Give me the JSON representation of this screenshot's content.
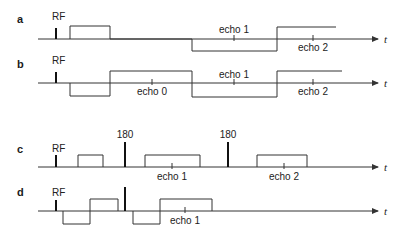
{
  "figure": {
    "width": 400,
    "height": 235,
    "colors": {
      "line": "#333333",
      "spike": "#111111",
      "text": "#222222",
      "background": "#ffffff"
    },
    "axis_end_x": 378,
    "axis_start_x": 38,
    "axis_label": "t",
    "panels": [
      {
        "id": "a",
        "label": "a",
        "baseline_y": 39,
        "label_y": 23,
        "spikes": [
          {
            "x": 56,
            "top": 28,
            "label": "RF",
            "label_y": 20
          }
        ],
        "waveform_points": [
          [
            70,
            39
          ],
          [
            70,
            26
          ],
          [
            110,
            26
          ],
          [
            110,
            39
          ],
          [
            192,
            39
          ],
          [
            192,
            51
          ],
          [
            277,
            51
          ],
          [
            277,
            27
          ],
          [
            336,
            27
          ]
        ],
        "echoes": [
          {
            "label": "echo 1",
            "x": 234,
            "position": "above",
            "label_y": 33
          },
          {
            "label": "echo 2",
            "x": 313,
            "position": "below",
            "label_y": 51
          }
        ]
      },
      {
        "id": "b",
        "label": "b",
        "baseline_y": 83,
        "label_y": 68,
        "spikes": [
          {
            "x": 56,
            "top": 72,
            "label": "RF",
            "label_y": 64
          }
        ],
        "waveform_points": [
          [
            70,
            83
          ],
          [
            70,
            96
          ],
          [
            110,
            96
          ],
          [
            110,
            71
          ],
          [
            192,
            71
          ],
          [
            192,
            97
          ],
          [
            277,
            97
          ],
          [
            277,
            71
          ],
          [
            342,
            71
          ]
        ],
        "echoes": [
          {
            "label": "echo 0",
            "x": 152,
            "position": "below",
            "label_y": 95
          },
          {
            "label": "echo 1",
            "x": 234,
            "position": "above",
            "label_y": 78
          },
          {
            "label": "echo 2",
            "x": 313,
            "position": "below",
            "label_y": 95
          }
        ]
      },
      {
        "id": "c",
        "label": "c",
        "baseline_y": 167,
        "label_y": 153,
        "spikes": [
          {
            "x": 56,
            "top": 155,
            "label": "RF",
            "label_y": 152
          },
          {
            "x": 125,
            "top": 142,
            "label": "180",
            "label_y": 138
          },
          {
            "x": 228,
            "top": 142,
            "label": "180",
            "label_y": 138
          }
        ],
        "waveform_points_list": [
          [
            [
              78,
              167
            ],
            [
              78,
              155
            ],
            [
              103,
              155
            ],
            [
              103,
              167
            ]
          ],
          [
            [
              145,
              167
            ],
            [
              145,
              155
            ],
            [
              200,
              155
            ],
            [
              200,
              167
            ]
          ],
          [
            [
              257,
              167
            ],
            [
              257,
              155
            ],
            [
              307,
              155
            ],
            [
              307,
              167
            ]
          ]
        ],
        "echoes": [
          {
            "label": "echo 1",
            "x": 172,
            "position": "below",
            "label_y": 180
          },
          {
            "label": "echo 2",
            "x": 284,
            "position": "below",
            "label_y": 180
          }
        ]
      },
      {
        "id": "d",
        "label": "d",
        "baseline_y": 211,
        "label_y": 196,
        "spikes": [
          {
            "x": 56,
            "top": 200,
            "label": "RF",
            "label_y": 196
          },
          {
            "x": 125,
            "top": 187,
            "label": ""
          }
        ],
        "waveform_points_list": [
          [
            [
              63,
              211
            ],
            [
              63,
              224
            ],
            [
              90,
              224
            ],
            [
              90,
              199
            ],
            [
              118,
              199
            ],
            [
              118,
              211
            ]
          ],
          [
            [
              133,
              211
            ],
            [
              133,
              224
            ],
            [
              160,
              224
            ],
            [
              160,
              199
            ],
            [
              212,
              199
            ],
            [
              212,
              211
            ]
          ]
        ],
        "echoes": [
          {
            "label": "echo 1",
            "x": 185,
            "position": "below",
            "label_y": 224
          }
        ]
      }
    ]
  }
}
